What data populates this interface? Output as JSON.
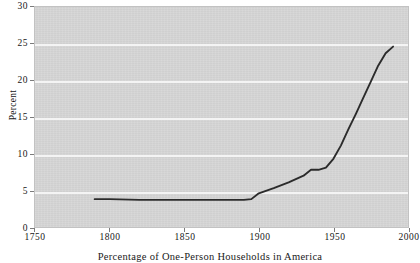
{
  "caption": "Percentage of One-Person Households in America",
  "axes": {
    "ylabel": "Percent",
    "xlabel": "",
    "yticks": [
      "0",
      "5",
      "10",
      "15",
      "20",
      "25",
      "30"
    ],
    "xticks": [
      "1750",
      "1800",
      "1850",
      "1900",
      "1950",
      "2000"
    ]
  },
  "colors": {
    "plot_background": "#d5d5d5",
    "gridline": "#f4f4f4",
    "line": "#2b2b2b",
    "text": "#171717",
    "page_background": "#ffffff"
  },
  "chart_data": {
    "type": "line",
    "title": "Percentage of One-Person Households in America",
    "xlabel": "",
    "ylabel": "Percent",
    "xlim": [
      1750,
      2000
    ],
    "ylim": [
      0,
      30
    ],
    "ytick_values": [
      0,
      5,
      10,
      15,
      20,
      25,
      30
    ],
    "xtick_values": [
      1750,
      1800,
      1850,
      1900,
      1950,
      2000
    ],
    "grid": "horizontal",
    "legend": "none",
    "series": [
      {
        "name": "One-person households",
        "x": [
          1790,
          1800,
          1820,
          1840,
          1860,
          1880,
          1890,
          1895,
          1900,
          1910,
          1920,
          1930,
          1935,
          1940,
          1945,
          1950,
          1955,
          1960,
          1965,
          1970,
          1975,
          1980,
          1985,
          1990
        ],
        "values": [
          3.8,
          3.8,
          3.7,
          3.7,
          3.7,
          3.7,
          3.7,
          3.8,
          4.6,
          5.3,
          6.1,
          7.0,
          7.8,
          7.8,
          8.1,
          9.3,
          11.1,
          13.3,
          15.4,
          17.6,
          19.8,
          22.0,
          23.7,
          24.6
        ]
      }
    ]
  }
}
